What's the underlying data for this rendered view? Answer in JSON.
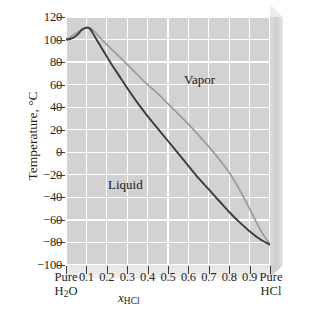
{
  "chart_data": {
    "type": "line",
    "title": "",
    "xlabel": "x_HCl",
    "ylabel": "Temperature, °C",
    "xlim": [
      0,
      1
    ],
    "ylim": [
      -100,
      120
    ],
    "grid": true,
    "legend_position": "none",
    "x_tick_labels": [
      "Pure H2O",
      "0.1",
      "0.2",
      "0.3",
      "0.4",
      "0.5",
      "0.6",
      "0.7",
      "0.8",
      "0.9",
      "Pure HCl"
    ],
    "x_tick_values": [
      0,
      0.1,
      0.2,
      0.3,
      0.4,
      0.5,
      0.6,
      0.7,
      0.8,
      0.9,
      1.0
    ],
    "y_tick_labels": [
      "120",
      "100",
      "80",
      "60",
      "40",
      "20",
      "0",
      "−20",
      "−40",
      "−60",
      "−80",
      "−100"
    ],
    "y_tick_values": [
      120,
      100,
      80,
      60,
      40,
      20,
      0,
      -20,
      -40,
      -60,
      -80,
      -100
    ],
    "annotations": [
      {
        "text": "Vapor",
        "x": 0.66,
        "y": 78
      },
      {
        "text": "Liquid",
        "x": 0.28,
        "y": -22
      }
    ],
    "series": [
      {
        "name": "Liquid (bubble-point) curve",
        "color": "#3c3c3c",
        "x": [
          0.0,
          0.02,
          0.04,
          0.06,
          0.08,
          0.1,
          0.11,
          0.12,
          0.14,
          0.18,
          0.22,
          0.26,
          0.3,
          0.35,
          0.4,
          0.45,
          0.5,
          0.55,
          0.6,
          0.65,
          0.7,
          0.75,
          0.8,
          0.85,
          0.9,
          0.95,
          1.0
        ],
        "y": [
          100,
          100.5,
          102,
          105,
          109,
          110.5,
          110.5,
          109,
          103,
          91,
          79,
          68,
          57,
          44,
          32,
          21,
          10,
          -1,
          -12,
          -23,
          -33,
          -43,
          -53,
          -62,
          -70,
          -77,
          -82
        ]
      },
      {
        "name": "Vapor (dew-point) curve",
        "color": "#9a9a9a",
        "x": [
          0.0,
          0.02,
          0.04,
          0.06,
          0.08,
          0.1,
          0.11,
          0.12,
          0.14,
          0.18,
          0.22,
          0.26,
          0.3,
          0.35,
          0.4,
          0.45,
          0.5,
          0.55,
          0.6,
          0.65,
          0.7,
          0.75,
          0.8,
          0.85,
          0.9,
          0.95,
          1.0
        ],
        "y": [
          100,
          102,
          104.5,
          107,
          109.5,
          110.5,
          110.5,
          110,
          107,
          99,
          92,
          85,
          78,
          69,
          60,
          52,
          43,
          34,
          25,
          15,
          5,
          -6,
          -18,
          -33,
          -50,
          -68,
          -82
        ]
      }
    ]
  },
  "axis": {
    "y_title": "Temperature, °C",
    "x_title_var": "x",
    "x_title_sub": "HCl",
    "x_end_left_line1": "Pure",
    "x_end_left_line2_pre": "H",
    "x_end_left_line2_sub": "2",
    "x_end_left_line2_post": "O",
    "x_end_right_line1": "Pure",
    "x_end_right_line2": "HCl"
  },
  "regions": {
    "vapor": "Vapor",
    "liquid": "Liquid"
  },
  "style": {
    "plot_background": "#d2d2d2",
    "gridline_color": "#ffffff",
    "liquid_curve_color": "#3c3c3c",
    "vapor_curve_color": "#9a9a9a",
    "text_color": "#231f20"
  }
}
